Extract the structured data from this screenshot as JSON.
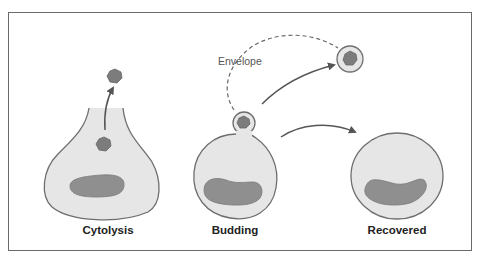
{
  "diagram": {
    "labels": {
      "cytolysis": "Cytolysis",
      "budding": "Budding",
      "recovered": "Recovered",
      "envelope": "Envelope"
    },
    "colors": {
      "cell_fill": "#e6e6e6",
      "cell_stroke": "#6e6e6e",
      "nucleus_fill": "#8f8f8f",
      "virus_fill": "#7c7c7c",
      "arrow": "#555555",
      "frame": "#6a6a6a"
    },
    "panels": [
      {
        "name": "cytolysis",
        "label": "Cytolysis",
        "description": "Cell membrane ruptures, virus particle released upward"
      },
      {
        "name": "budding",
        "label": "Budding",
        "description": "Virus buds off acquiring envelope, released as enveloped particle"
      },
      {
        "name": "recovered",
        "label": "Recovered",
        "description": "Cell recovers after budding"
      }
    ]
  }
}
